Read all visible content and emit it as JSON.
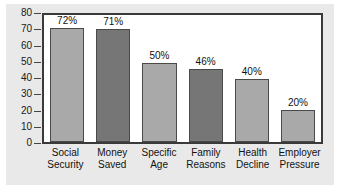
{
  "chart_data": {
    "type": "bar",
    "title": "",
    "xlabel": "",
    "ylabel": "",
    "ylim": [
      0,
      80
    ],
    "ytick_step": 10,
    "grid": false,
    "legend": "none",
    "categories": [
      "Social Security",
      "Money Saved",
      "Specific Age",
      "Family Reasons",
      "Health Decline",
      "Employer Pressure"
    ],
    "category_lines": [
      [
        "Social",
        "Security"
      ],
      [
        "Money",
        "Saved"
      ],
      [
        "Specific",
        "Age"
      ],
      [
        "Family",
        "Reasons"
      ],
      [
        "Health",
        "Decline"
      ],
      [
        "Employer",
        "Pressure"
      ]
    ],
    "values": [
      72,
      71,
      50,
      46,
      40,
      20
    ],
    "data_labels": [
      "72%",
      "71%",
      "50%",
      "46%",
      "40%",
      "20%"
    ],
    "bar_shades": [
      "light",
      "dark",
      "light",
      "dark",
      "light",
      "light"
    ],
    "ytick_labels": [
      "80",
      "70",
      "60",
      "50",
      "40",
      "30",
      "20",
      "10",
      "0"
    ],
    "ytick_values": [
      80,
      70,
      60,
      50,
      40,
      30,
      20,
      10,
      0
    ],
    "colors": {
      "bar_light": "#a9a9a9",
      "bar_dark": "#767676",
      "bar_border": "#4a4a4a",
      "plot_border": "#3a3a3a",
      "plot_background": "#ffffff",
      "card_background": "#e9e9e9",
      "text": "#111111"
    }
  }
}
